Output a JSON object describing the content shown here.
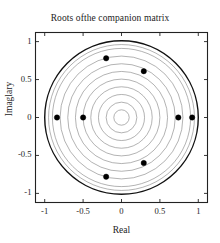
{
  "chart_data": {
    "type": "scatter",
    "title": "Roots ofthe companion matrix",
    "xlabel": "Real",
    "ylabel": "Imaglary",
    "xlim": [
      -1.12,
      1.12
    ],
    "ylim": [
      -1.12,
      1.12
    ],
    "grid": false,
    "legend": null,
    "xticks": [
      -1,
      -0.5,
      0,
      0.5,
      1
    ],
    "xticklabels": [
      "-1",
      "-0.5",
      "0",
      "0.5",
      "1"
    ],
    "yticks": [
      -1,
      -0.5,
      0,
      0.5,
      1
    ],
    "yticklabels": [
      "-1",
      "-0.5",
      "0",
      "0.5",
      "1"
    ],
    "series": [
      {
        "name": "roots",
        "marker": "filled-circle",
        "color": "#000000",
        "points": [
          {
            "real": -0.84,
            "imag": 0.0
          },
          {
            "real": -0.5,
            "imag": 0.0
          },
          {
            "real": -0.2,
            "imag": 0.78
          },
          {
            "real": 0.29,
            "imag": 0.61
          },
          {
            "real": 0.74,
            "imag": 0.0
          },
          {
            "real": 0.92,
            "imag": 0.0
          },
          {
            "real": 0.29,
            "imag": -0.6
          },
          {
            "real": -0.2,
            "imag": -0.78
          }
        ]
      },
      {
        "name": "unit-circle",
        "type": "circle",
        "radius": 1.0,
        "color": "#111111",
        "linewidth": 1.4
      },
      {
        "name": "concentric-circles",
        "type": "circles",
        "radii": [
          0.1,
          0.2,
          0.3,
          0.4,
          0.5,
          0.6,
          0.7,
          0.8,
          0.9,
          0.95
        ],
        "color": "#666666",
        "linewidth": 0.5
      }
    ]
  },
  "colors": {
    "axis": "#222222",
    "marker": "#000000",
    "unit_circle": "#111111",
    "inner_circle": "#666666",
    "background": "#ffffff"
  }
}
